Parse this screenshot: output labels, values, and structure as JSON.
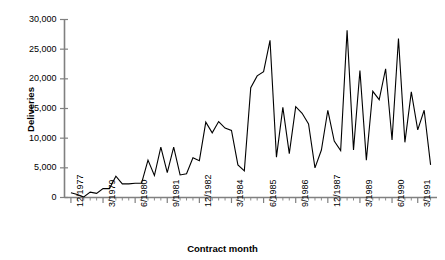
{
  "chart_data": {
    "type": "line",
    "title": "",
    "subtitle": "",
    "xlabel": "Contract month",
    "ylabel": "Deliveries",
    "ylim": [
      0,
      30000
    ],
    "ytick_labels": [
      "0",
      "5,000",
      "10,000",
      "15,000",
      "20,000",
      "25,000",
      "30,000"
    ],
    "ytick_values": [
      0,
      5000,
      10000,
      15000,
      20000,
      25000,
      30000
    ],
    "xtick_labels": [
      "12/1977",
      "3/1979",
      "6/1980",
      "9/1981",
      "12/1982",
      "3/1984",
      "6/1985",
      "9/1986",
      "12/1987",
      "3/1989",
      "6/1990",
      "3/1991"
    ],
    "xtick_indices": [
      0,
      5,
      10,
      15,
      20,
      25,
      30,
      35,
      40,
      45,
      50,
      54
    ],
    "grid": false,
    "legend": false,
    "legend_position": "none",
    "line_color": "#000000",
    "axis_color": "#808080",
    "series": [
      {
        "name": "Deliveries",
        "values": [
          800,
          500,
          100,
          900,
          700,
          1500,
          1500,
          3600,
          2300,
          2300,
          2400,
          2400,
          6300,
          3700,
          8500,
          4200,
          8500,
          3800,
          4000,
          6700,
          6200,
          12700,
          10900,
          12800,
          11700,
          11300,
          5500,
          4500,
          18500,
          20500,
          21200,
          26500,
          6800,
          15200,
          7400,
          15300,
          14200,
          12400,
          5000,
          8000,
          14700,
          9500,
          7900,
          28200,
          8000,
          21400,
          6300,
          17900,
          16500,
          21700,
          9700,
          26800,
          9300,
          17800,
          11400,
          14700,
          5500
        ]
      }
    ]
  },
  "axis_titles": {
    "y": "Deliveries",
    "x": "Contract month"
  }
}
